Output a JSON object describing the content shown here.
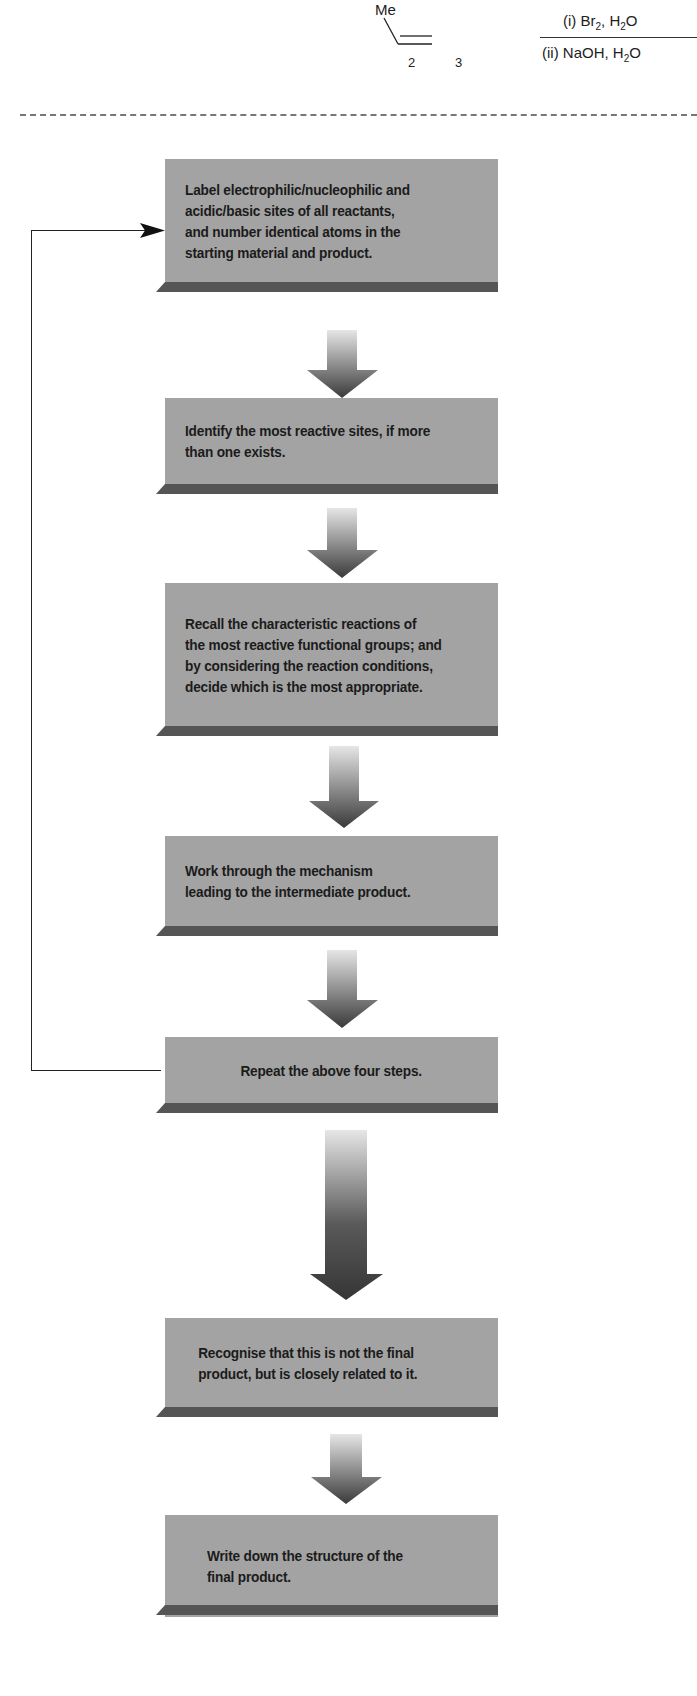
{
  "reaction": {
    "substituent": "Me",
    "atom_labels": [
      "2",
      "3"
    ],
    "reagents": {
      "step1": "(i) Br₂, H₂O",
      "step1_parts": {
        "pre": "(i) Br",
        "sub1": "2",
        "mid": ", H",
        "sub2": "2",
        "post": "O"
      },
      "step2": "(ii) NaOH, H₂O",
      "step2_parts": {
        "pre": "(ii) NaOH, H",
        "sub": "2",
        "post": "O"
      }
    }
  },
  "flowchart": {
    "steps": [
      {
        "text": "Label electrophilic/nucleophilic and\nacidic/basic sites of all reactants,\nand number identical atoms in the\nstarting material and product."
      },
      {
        "text": "Identify the most reactive sites, if more\nthan one exists."
      },
      {
        "text": "Recall the characteristic reactions of\nthe most reactive functional groups; and\nby considering the reaction conditions,\ndecide which is the most appropriate."
      },
      {
        "text": "Work through the mechanism\nleading to the intermediate product."
      },
      {
        "text": "Repeat the above four steps."
      },
      {
        "text": "Recognise that this is not the final\nproduct, but is closely related to it."
      },
      {
        "text": "Write down the structure of the\nfinal product."
      }
    ],
    "feedback_loop": {
      "from_step": 5,
      "to_step": 1
    },
    "colors": {
      "box_fill": "#a3a3a3",
      "box_base": "#555555",
      "arrow_dark": "#3a3a3a",
      "arrow_light": "#e6e6e6",
      "text": "#1b1b1b"
    }
  }
}
